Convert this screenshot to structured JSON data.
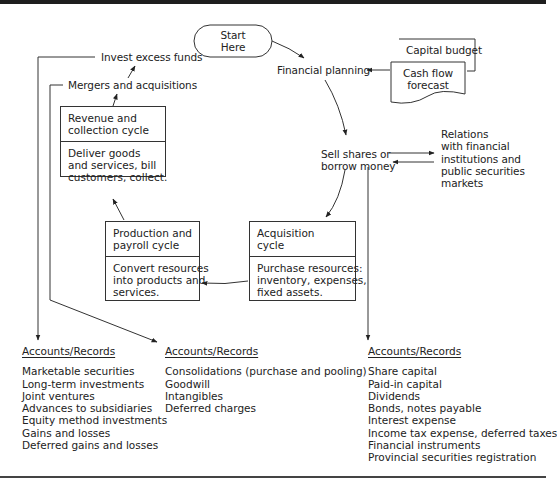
{
  "diagram": {
    "start": {
      "lines": [
        "Start",
        "Here"
      ]
    },
    "financial_planning": "Financial planning",
    "capital_budget": "Capital budget",
    "cash_flow_forecast": {
      "lines": [
        "Cash flow",
        "forecast"
      ]
    },
    "sell_shares": {
      "lines": [
        "Sell shares or",
        "borrow money"
      ]
    },
    "relations": {
      "lines": [
        "Relations",
        "with financial",
        "institutions and",
        "public securities",
        "markets"
      ]
    },
    "invest_excess_funds": "Invest excess funds",
    "mergers_acquisitions": "Mergers and acquisitions",
    "revenue_cycle": {
      "title": [
        "Revenue and",
        "collection cycle"
      ],
      "body": [
        "Deliver goods",
        "and services, bill",
        "customers, collect."
      ]
    },
    "production_cycle": {
      "title": [
        "Production and",
        "payroll cycle"
      ],
      "body": [
        "Convert resources",
        "into products and",
        "services."
      ]
    },
    "acquisition_cycle": {
      "title": [
        "Acquisition",
        "cycle"
      ],
      "body": [
        "Purchase resources:",
        "inventory, expenses,",
        "fixed assets."
      ]
    },
    "accounts": [
      {
        "heading": "Accounts/Records",
        "items": [
          "Marketable securities",
          "Long-term investments",
          "Joint ventures",
          "Advances to subsidiaries",
          "Equity method investments",
          "Gains and losses",
          "Deferred gains and losses"
        ]
      },
      {
        "heading": "Accounts/Records",
        "items": [
          "Consolidations (purchase and pooling)",
          "Goodwill",
          "Intangibles",
          "Deferred charges"
        ]
      },
      {
        "heading": "Accounts/Records",
        "items": [
          "Share capital",
          "Paid-in capital",
          "Dividends",
          "Bonds, notes payable",
          "Interest expense",
          "Income tax expense, deferred taxes",
          "Financial instruments",
          "Provincial securities registration"
        ]
      }
    ]
  },
  "colors": {
    "line": "#333333",
    "text": "#222222",
    "rule": "#1e1e1e"
  }
}
